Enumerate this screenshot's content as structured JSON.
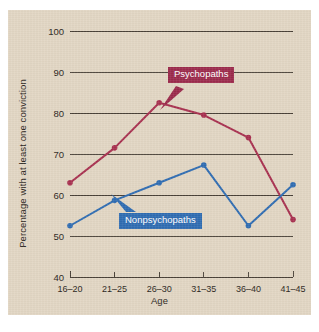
{
  "chart_data": {
    "type": "line",
    "title": "",
    "xlabel": "Age",
    "ylabel": "Percentage with at least one conviction",
    "categories": [
      "16–20",
      "21–25",
      "26–30",
      "31–35",
      "36–40",
      "41–45"
    ],
    "ylim": [
      40,
      100
    ],
    "yticks": [
      40,
      50,
      60,
      70,
      80,
      90,
      100
    ],
    "grid": true,
    "legend_position": "inline-callouts",
    "series": [
      {
        "name": "Psychopaths",
        "color": "#a8304f",
        "values": [
          63,
          71.5,
          82.5,
          79.5,
          74,
          54
        ]
      },
      {
        "name": "Nonpsychopaths",
        "color": "#2f6cb2",
        "values": [
          52.5,
          58.7,
          63,
          67.3,
          52.5,
          62.5
        ]
      }
    ]
  },
  "style": {
    "panel_background": "#e2d6c3",
    "page_background": "#ffffff",
    "gridline_color": "#4a4238",
    "axis_color": "#4a4238",
    "text_color": "#2a2520",
    "psychopaths_color": "#a8304f",
    "psychopaths_callout_fill": "#9c2a4c",
    "nonpsychopaths_color": "#2f6cb2",
    "nonpsychopaths_callout_fill": "#2f6cb2"
  }
}
